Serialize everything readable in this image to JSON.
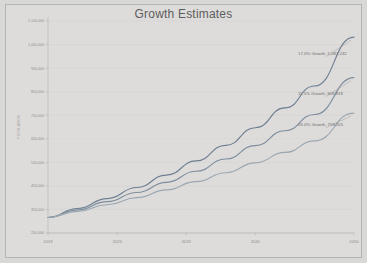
{
  "chart_data": {
    "type": "line",
    "title": "Growth Estimates",
    "xlabel": "",
    "ylabel": "POPULATION",
    "grid": true,
    "legend_position": "none",
    "x": [
      2019,
      2026,
      2033,
      2040,
      2050
    ],
    "x_tick_labels": [
      "2019",
      "2026",
      "2033",
      "2040",
      "2050"
    ],
    "xlim": [
      2019,
      2050
    ],
    "ylim": [
      250000,
      1150000
    ],
    "y_tick_values": [
      250000,
      350000,
      450000,
      550000,
      650000,
      750000,
      850000,
      950000,
      1050000,
      1150000
    ],
    "y_tick_labels": [
      "250,000",
      "350,000",
      "450,000",
      "550,000",
      "650,000",
      "750,000",
      "850,000",
      "950,000",
      "1,050,000",
      "1,150,000"
    ],
    "series": [
      {
        "name": "17.0% Growth",
        "color": "#6e7f93",
        "end_label": "17.0% Growth, 1,081,242",
        "end_value": 1081242,
        "x": [
          2019,
          2022,
          2025,
          2028,
          2031,
          2034,
          2037,
          2040,
          2043,
          2046,
          2050
        ],
        "values": [
          316000,
          354000,
          396000,
          443000,
          496000,
          556000,
          622000,
          697000,
          781000,
          874000,
          1081242
        ]
      },
      {
        "name": "11.5% Growth",
        "color": "#7e8e9e",
        "end_label": "11.5% Growth, 909,818",
        "end_value": 909818,
        "x": [
          2019,
          2022,
          2025,
          2028,
          2031,
          2034,
          2037,
          2040,
          2043,
          2046,
          2050
        ],
        "values": [
          316000,
          348000,
          383000,
          422000,
          465000,
          512000,
          564000,
          621000,
          684000,
          753000,
          909818
        ]
      },
      {
        "name": "26.0% Growth",
        "color": "#9aa7b3",
        "end_label": "26.0% Growth, 759,205",
        "end_value": 759205,
        "x": [
          2019,
          2022,
          2025,
          2028,
          2031,
          2034,
          2037,
          2040,
          2043,
          2046,
          2050
        ],
        "values": [
          316000,
          342000,
          370000,
          400000,
          433000,
          468000,
          506000,
          548000,
          592000,
          641000,
          759205
        ]
      }
    ]
  }
}
